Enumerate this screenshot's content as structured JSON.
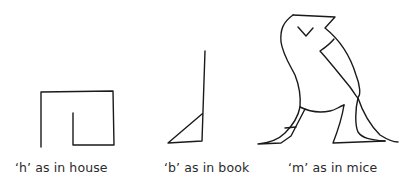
{
  "figure": {
    "glyphs": [
      {
        "id": "house",
        "letter": "h",
        "caption": "‘h’ as in house"
      },
      {
        "id": "book",
        "letter": "b",
        "caption": "‘b’ as in book"
      },
      {
        "id": "mice",
        "letter": "m",
        "caption": "‘m’ as in mice"
      }
    ],
    "stroke_color": "#1a1a1a",
    "background": "#ffffff"
  }
}
